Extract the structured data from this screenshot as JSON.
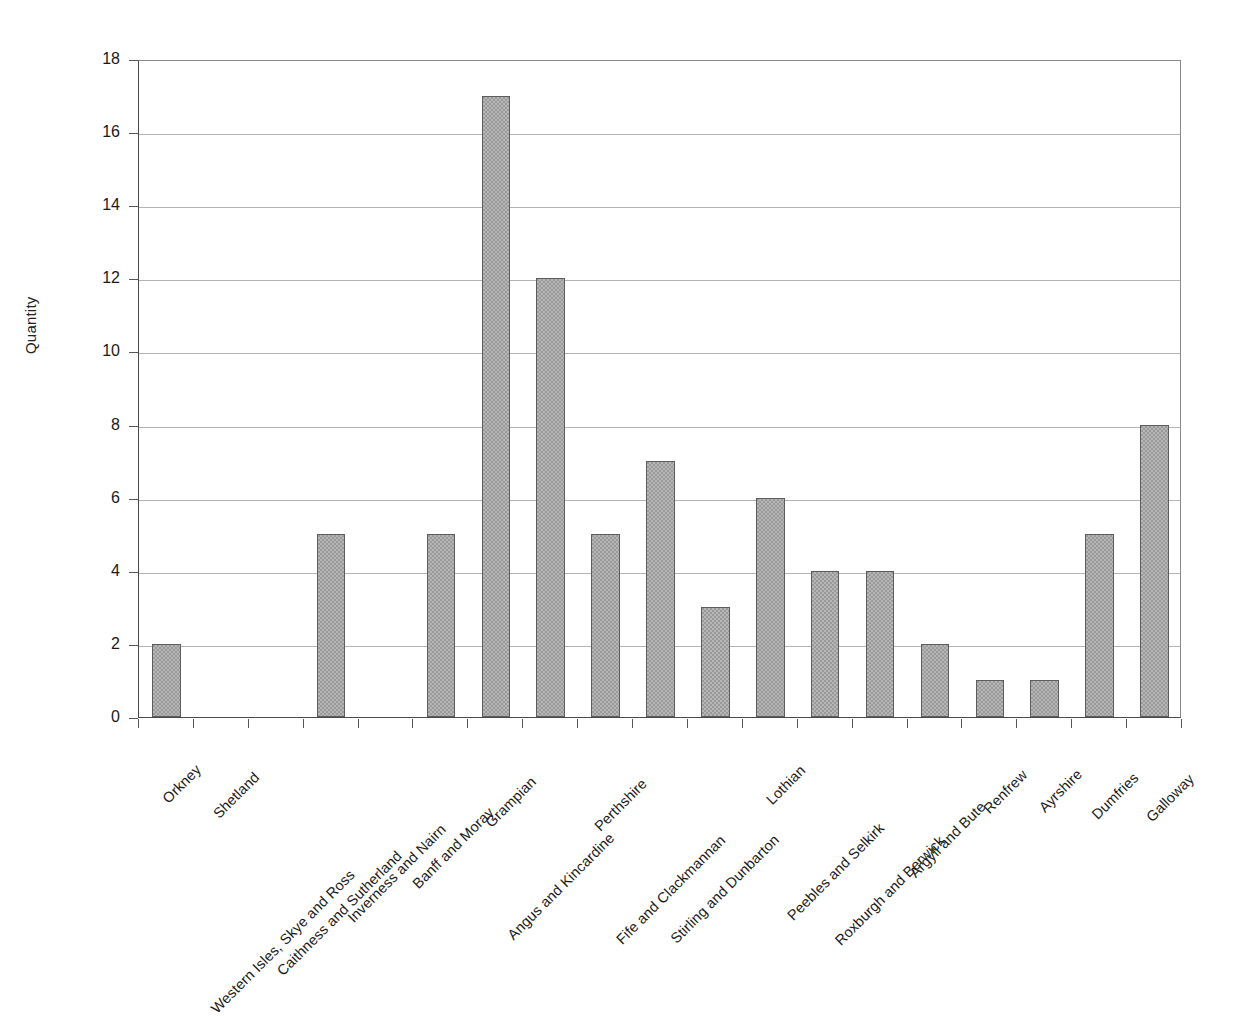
{
  "chart_data": {
    "type": "bar",
    "title": "",
    "xlabel": "",
    "ylabel": "Quantity",
    "ylim": [
      0,
      18
    ],
    "ytick_step": 2,
    "yticks": [
      0,
      2,
      4,
      6,
      8,
      10,
      12,
      14,
      16,
      18
    ],
    "grid": true,
    "legend": "none",
    "bar_color": "#9a9a9a",
    "bar_border_color": "#5d5d5d",
    "gridline_color": "#b4b4b4",
    "axis_color": "#4a4a4a",
    "background_color": "#ffffff",
    "categories": [
      "Orkney",
      "Shetland",
      "Western Isles, Skye and Ross",
      "Caithness and Sutherland",
      "Inverness and Nairn",
      "Banff and Moray",
      "Grampian",
      "Angus and Kincardine",
      "Perthshire",
      "Fife and Clackmannan",
      "Stirling and Dunbarton",
      "Lothian",
      "Peebles and Selkirk",
      "Roxburgh and Berwick",
      "Argyll and Bute",
      "Renfrew",
      "Ayrshire",
      "Dumfries",
      "Galloway"
    ],
    "values": [
      2,
      0,
      0,
      5,
      0,
      5,
      17,
      12,
      5,
      7,
      3,
      6,
      4,
      4,
      2,
      1,
      1,
      5,
      8
    ]
  }
}
